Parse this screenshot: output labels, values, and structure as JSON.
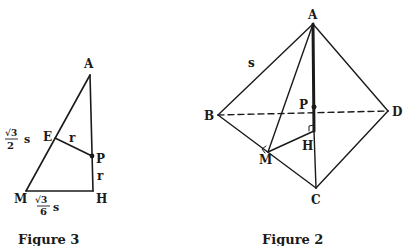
{
  "figure3": {
    "caption": "Figure 3",
    "points": {
      "A": {
        "label": "A",
        "x": 90,
        "y": 75
      },
      "M": {
        "label": "M",
        "x": 26,
        "y": 191
      },
      "H": {
        "label": "H",
        "x": 93,
        "y": 191
      },
      "E": {
        "label": "E",
        "x": 55,
        "y": 138
      },
      "P": {
        "label": "P",
        "x": 92,
        "y": 156
      }
    },
    "labels": {
      "ep_length": "r",
      "ph_length": "r",
      "am_num": "√3",
      "am_den": "2",
      "am_var": "s",
      "mh_num": "√3",
      "mh_den": "6",
      "mh_var": "s"
    }
  },
  "figure2": {
    "caption": "Figure 2",
    "points": {
      "A": {
        "label": "A",
        "x": 313,
        "y": 24
      },
      "B": {
        "label": "B",
        "x": 218,
        "y": 115
      },
      "C": {
        "label": "C",
        "x": 316,
        "y": 188
      },
      "D": {
        "label": "D",
        "x": 388,
        "y": 111
      },
      "M": {
        "label": "M",
        "x": 268,
        "y": 152
      },
      "H": {
        "label": "H",
        "x": 314,
        "y": 131
      },
      "P": {
        "label": "P",
        "x": 314,
        "y": 107
      }
    },
    "labels": {
      "ab_length": "s"
    }
  }
}
